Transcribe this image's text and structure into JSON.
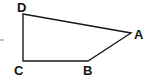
{
  "diagram": {
    "type": "quadrilateral",
    "stroke_color": "#1a1a1a",
    "background": "#ffffff",
    "vertices": [
      {
        "label": "A",
        "x": 131,
        "y": 33
      },
      {
        "label": "B",
        "x": 88,
        "y": 61
      },
      {
        "label": "C",
        "x": 23,
        "y": 61
      },
      {
        "label": "D",
        "x": 23,
        "y": 14
      }
    ],
    "edges": [
      "DA",
      "AB",
      "BC",
      "CD"
    ],
    "labels": {
      "A": "A",
      "B": "B",
      "C": "C",
      "D": "D"
    }
  }
}
